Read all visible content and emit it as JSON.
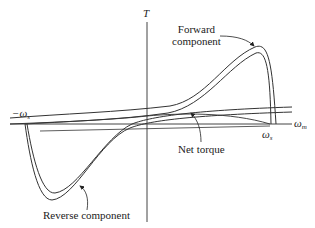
{
  "diagram": {
    "type": "torque-speed characteristic",
    "axes": {
      "vertical_label": "T",
      "horizontal_label_main": "ω",
      "horizontal_label_sub": "m"
    },
    "ticks": {
      "negative_sync_main": "−ω",
      "negative_sync_sub": "s",
      "positive_sync_main": "ω",
      "positive_sync_sub": "s"
    },
    "annotations": {
      "forward_line1": "Forward",
      "forward_line2": "component",
      "net_torque": "Net torque",
      "reverse": "Reverse component"
    },
    "colors": {
      "stroke": "#333333",
      "axis": "#444444",
      "background": "#ffffff"
    }
  }
}
